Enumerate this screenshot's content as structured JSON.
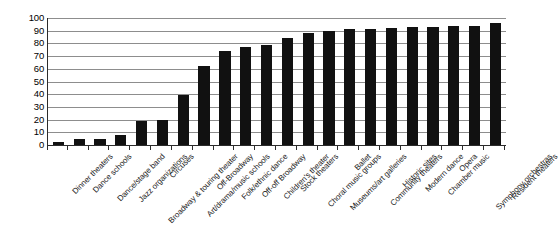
{
  "chart_data": {
    "type": "bar",
    "title": "",
    "subtitle": "",
    "xlabel": "",
    "ylabel": "",
    "ylim": [
      0,
      100
    ],
    "ytick_step": 10,
    "yticks": [
      100,
      90,
      80,
      70,
      60,
      50,
      40,
      30,
      20,
      10,
      0
    ],
    "grid": true,
    "legend": false,
    "legend_position": "none",
    "bar_color": "#111111",
    "gridline_color": "#8d8d8d",
    "axis_color": "#2b2b2b",
    "categories": [
      "Dinner theaters",
      "Dance schools",
      "Dance/stage band",
      "Jazz organizations",
      "Broadway & touring theater",
      "Circuses",
      "Art/drama/music schools",
      "Off-Broadway",
      "Folk/ethnic dance",
      "Off-off Broadway",
      "Children's theater",
      "Stock theaters",
      "Choral music groups",
      "Museums/art galleries",
      "Ballet",
      "Community theaters",
      "Historic sites",
      "Modern dance",
      "Chamber music",
      "Opera",
      "Symphony orchestras",
      "Resident theaters"
    ],
    "values": [
      2,
      5,
      5,
      8,
      19,
      20,
      39,
      62,
      74,
      77,
      79,
      84,
      88,
      90,
      91,
      91,
      92,
      93,
      93,
      94,
      94,
      96
    ]
  }
}
